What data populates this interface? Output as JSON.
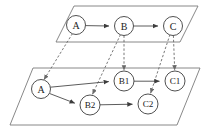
{
  "figure": {
    "background_color": "#ffffff",
    "line_color": "#4a4a4a",
    "plane_color": "#7a7a7a",
    "dashed_color": "#6a6a6a",
    "node_fill": "#ffffff",
    "node_stroke": "#3d3d3d",
    "label_color": "#1c1c1c"
  },
  "planes": [
    {
      "id": "upper-plane",
      "name": "abstract-level-plane",
      "points": "74,6 198,6 180,42 56,42"
    },
    {
      "id": "lower-plane",
      "name": "concrete-level-plane",
      "points": "33,68 200,68 177,125 10,125"
    }
  ],
  "nodes": {
    "upper": [
      {
        "id": "A",
        "label": "A",
        "cx": 76,
        "cy": 25,
        "r": 9.5
      },
      {
        "id": "B",
        "label": "B",
        "cx": 124,
        "cy": 26,
        "r": 9.5
      },
      {
        "id": "C",
        "label": "C",
        "cx": 173,
        "cy": 26,
        "r": 9.5
      }
    ],
    "lower": [
      {
        "id": "A2",
        "label": "A",
        "cx": 41,
        "cy": 89,
        "r": 9.5
      },
      {
        "id": "B1",
        "label": "B1",
        "cx": 124,
        "cy": 81,
        "r": 10
      },
      {
        "id": "C1",
        "label": "C1",
        "cx": 175,
        "cy": 81,
        "r": 10
      },
      {
        "id": "B2",
        "label": "B2",
        "cx": 90,
        "cy": 105,
        "r": 10
      },
      {
        "id": "C2",
        "label": "C2",
        "cx": 148,
        "cy": 104,
        "r": 10
      }
    ]
  },
  "solid_edges": [
    {
      "name": "edge-A-to-B",
      "from": "A",
      "to": "B"
    },
    {
      "name": "edge-B-to-C",
      "from": "B",
      "to": "C"
    },
    {
      "name": "edge-A2-to-B1",
      "from": "A2",
      "to": "B1"
    },
    {
      "name": "edge-B1-to-C1",
      "from": "B1",
      "to": "C1"
    },
    {
      "name": "edge-A2-to-B2",
      "from": "A2",
      "to": "B2"
    },
    {
      "name": "edge-B2-to-C2",
      "from": "B2",
      "to": "C2"
    }
  ],
  "dashed_edges": [
    {
      "name": "projection-A-to-A2",
      "from": "A",
      "to": "A2"
    },
    {
      "name": "projection-B-to-B1",
      "from": "B",
      "to": "B1"
    },
    {
      "name": "projection-B-to-B2",
      "from": "B",
      "to": "B2"
    },
    {
      "name": "projection-C-to-C1",
      "from": "C",
      "to": "C1"
    },
    {
      "name": "projection-C-to-C2",
      "from": "C",
      "to": "C2"
    }
  ],
  "labels": {
    "upper_a": "A",
    "upper_b": "B",
    "upper_c": "C",
    "lower_a": "A",
    "lower_b1": "B1",
    "lower_c1": "C1",
    "lower_b2": "B2",
    "lower_c2": "C2"
  }
}
